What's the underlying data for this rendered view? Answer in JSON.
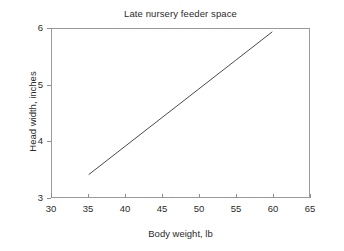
{
  "chart_data": {
    "type": "line",
    "title": "Late nursery feeder space",
    "xlabel": "Body weight, lb",
    "ylabel": "Head width, inches",
    "xlim": [
      30,
      65
    ],
    "ylim": [
      3,
      6
    ],
    "xticks": [
      30,
      35,
      40,
      45,
      50,
      55,
      60,
      65
    ],
    "yticks": [
      3,
      4,
      5,
      6
    ],
    "grid": false,
    "legend": null,
    "series": [
      {
        "name": "Head width vs body weight",
        "color": "#4a4a4a",
        "x": [
          35,
          40,
          45,
          50,
          55,
          60
        ],
        "values": [
          3.4,
          3.91,
          4.42,
          4.93,
          5.44,
          5.95
        ]
      }
    ]
  },
  "figure": {
    "background_color": "#ffffff",
    "frame_color": "#9a9a9a",
    "text_color": "#2b2b2b"
  }
}
